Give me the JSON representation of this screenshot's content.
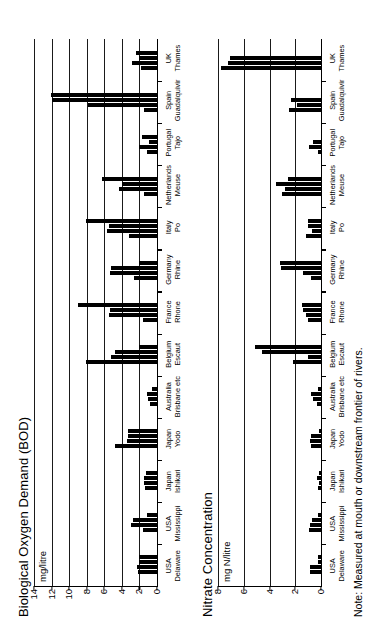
{
  "note": "Note: Measured at mouth or downstream frontier of rivers.",
  "chart_data": [
    {
      "type": "bar",
      "id": "bod",
      "title": "Biological Oxygen Demand (BOD)",
      "ylabel": "mg/litre",
      "xlabel": "",
      "ylim": [
        0,
        14
      ],
      "yticks": [
        0,
        2,
        4,
        6,
        8,
        10,
        12,
        14
      ],
      "grid": true,
      "legend": "none",
      "categories": [
        "USA\nDelaware",
        "USA\nMississippi",
        "Japan\nIshikari",
        "Japan\nYodo",
        "Australia\nBrisbane etc",
        "Belgium\nEscaut",
        "France\nRhone",
        "Germany\nRhine",
        "Italy\nPo",
        "Netherlands\nMeuse",
        "Portugal\nTajo",
        "Spain\nGuadalquivir",
        "UK\nThames"
      ],
      "values": [
        [
          2.2,
          2.3,
          2.0,
          2.0
        ],
        [
          1.6,
          3.0,
          2.7,
          1.1
        ],
        [
          1.4,
          1.5,
          1.5,
          1.3
        ],
        [
          4.8,
          3.4,
          3.3,
          3.3
        ],
        [
          0.8,
          1.0,
          1.1,
          0.6
        ],
        [
          8.1,
          5.2,
          4.8,
          2.0
        ],
        [
          1.6,
          5.5,
          5.4,
          9.0
        ],
        [
          2.6,
          5.3,
          5.2,
          2.0
        ],
        [
          3.2,
          5.7,
          5.5,
          8.1
        ],
        [
          1.5,
          4.3,
          4.0,
          6.3
        ],
        [
          1.1,
          2.0,
          0.9,
          1.7
        ],
        [
          1.5,
          7.8,
          11.9,
          12.1
        ],
        [
          1.8,
          2.8,
          2.1,
          2.4
        ]
      ]
    },
    {
      "type": "bar",
      "id": "nitrate",
      "title": "Nitrate Concentration",
      "ylabel": "mg N/litre",
      "xlabel": "",
      "ylim": [
        0,
        8
      ],
      "yticks": [
        0,
        2,
        4,
        6,
        8
      ],
      "grid": true,
      "legend": "none",
      "categories": [
        "USA\nDelaware",
        "USA\nMississippi",
        "Japan\nIshikari",
        "Japan\nYodo",
        "Australia\nBrisbane etc",
        "Belgium\nEscaut",
        "France\nRhone",
        "Germany\nRhine",
        "Italy\nPo",
        "Netherlands\nMeuse",
        "Portugal\nTajo",
        "Spain\nGuadalquivir",
        "UK\nThames"
      ],
      "values": [
        [
          0.85,
          0.85,
          0.25,
          0.25
        ],
        [
          0.9,
          0.85,
          0.7,
          0.2
        ],
        [
          0.25,
          0.15,
          0.35,
          0.15
        ],
        [
          0.75,
          0.85,
          0.8,
          0.15
        ],
        [
          0.3,
          0.6,
          0.8,
          0.2
        ],
        [
          2.2,
          1.0,
          4.6,
          5.1
        ],
        [
          1.0,
          1.2,
          1.4,
          1.5
        ],
        [
          0.8,
          1.4,
          3.1,
          3.2
        ],
        [
          1.2,
          0.7,
          1.0,
          1.0
        ],
        [
          3.0,
          2.8,
          3.5,
          2.6
        ],
        [
          0.2,
          0.9,
          0.6,
          0.0
        ],
        [
          2.5,
          1.9,
          2.3,
          0.0
        ],
        [
          7.8,
          7.2,
          7.1,
          0.0
        ]
      ]
    }
  ]
}
